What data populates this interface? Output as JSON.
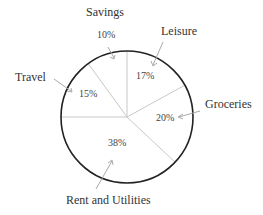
{
  "chart_data": {
    "type": "pie",
    "title": "",
    "categories": [
      "Leisure",
      "Groceries",
      "Rent and Utilities",
      "Travel",
      "Savings"
    ],
    "values": [
      17,
      20,
      38,
      15,
      10
    ],
    "value_labels": [
      "17%",
      "20%",
      "38%",
      "15%",
      "10%"
    ],
    "unit": "%",
    "start_angle_deg": 0,
    "direction": "clockwise",
    "legend": "none",
    "labels_style": "external labels with arrows"
  },
  "colors": {
    "outline": "#222222",
    "divider": "#c8c8c8",
    "arrow": "#aaaaaa",
    "fill": "#ffffff"
  },
  "labels": {
    "savings": "Savings",
    "leisure": "Leisure",
    "travel": "Travel",
    "groceries": "Groceries",
    "rent": "Rent and Utilities"
  },
  "percents": {
    "savings": "10%",
    "leisure": "17%",
    "travel": "15%",
    "groceries": "20%",
    "rent": "38%"
  }
}
